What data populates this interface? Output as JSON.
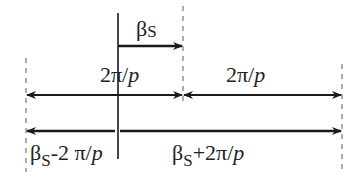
{
  "diagram": {
    "labels": {
      "beta_s": {
        "main": "β",
        "sub": "S"
      },
      "period_left": {
        "num": "2π/",
        "var": "p"
      },
      "period_right": {
        "num": "2π/",
        "var": "p"
      },
      "minus": {
        "main": "β",
        "sub": "S",
        "rest": "-2 π/",
        "var": "p"
      },
      "plus": {
        "main": "β",
        "sub": "S",
        "rest": "+2π/",
        "var": "p"
      }
    },
    "colors": {
      "line": "#1a1a1a",
      "dashed": "#777777"
    }
  }
}
